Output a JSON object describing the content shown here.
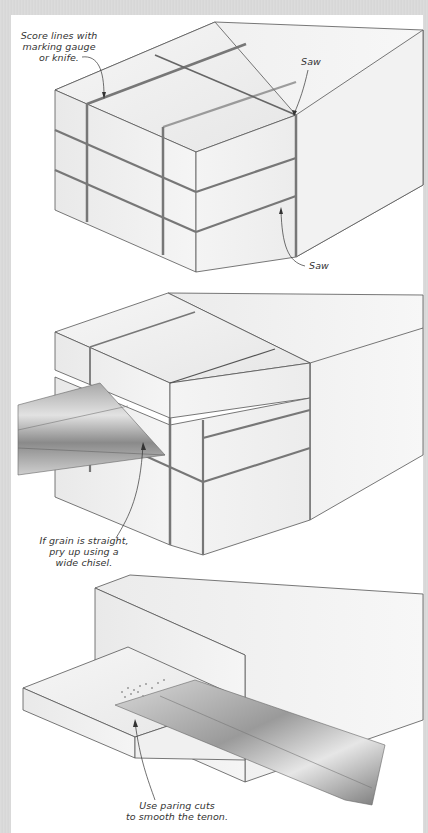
{
  "figure": {
    "background_color": "#ffffff",
    "border_color": "#d8d8d8",
    "panels": [
      {
        "id": "step-1",
        "description": "Block with scored lines and saw cuts forming a tenon",
        "callouts": [
          {
            "id": "score-lines",
            "text": "Score lines with\nmarking gauge\nor knife."
          },
          {
            "id": "saw-top",
            "text": "Saw"
          },
          {
            "id": "saw-side",
            "text": "Saw"
          }
        ]
      },
      {
        "id": "step-2",
        "description": "Chisel prying waste from the cheek",
        "callouts": [
          {
            "id": "pry-chisel",
            "text": "If grain is straight,\npry up using a\nwide chisel."
          }
        ]
      },
      {
        "id": "step-3",
        "description": "Chisel paring the tenon cheek smooth",
        "callouts": [
          {
            "id": "paring-cuts",
            "text": "Use paring cuts\nto smooth the tenon."
          }
        ]
      }
    ]
  }
}
